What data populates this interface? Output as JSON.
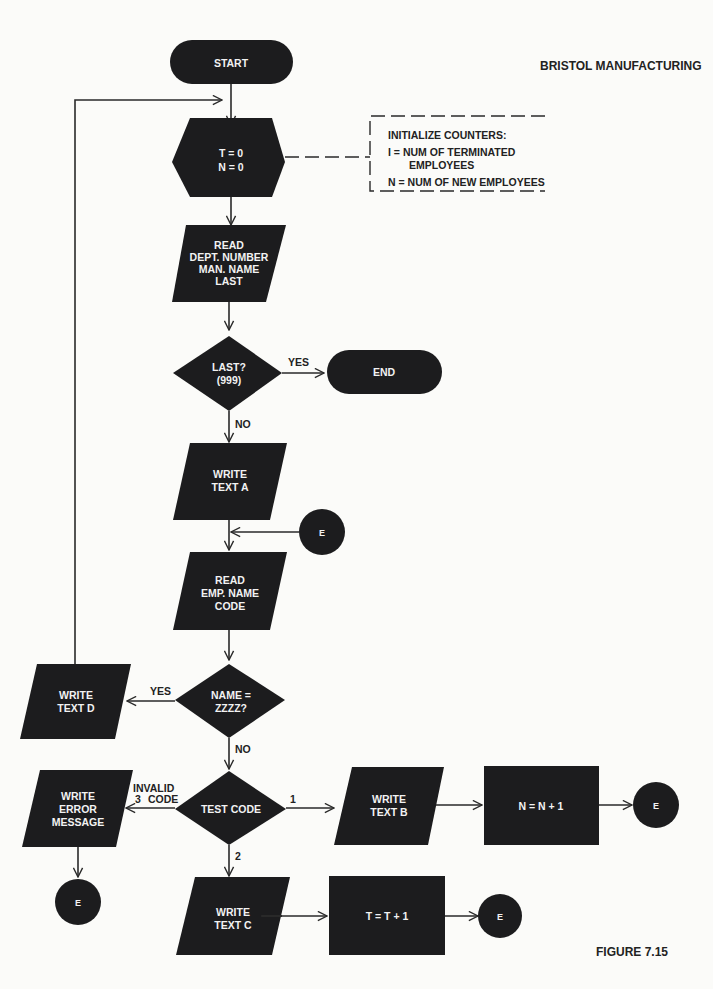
{
  "header": {
    "title": "BRISTOL MANUFACTURING"
  },
  "figure_label": "FIGURE 7.15",
  "annotation": {
    "title": "INITIALIZE COUNTERS:",
    "line1": "I  = NUM OF TERMINATED",
    "line1b": "EMPLOYEES",
    "line2": "N = NUM OF NEW EMPLOYEES"
  },
  "nodes": {
    "start": "START",
    "init": [
      "T = 0",
      "N = 0"
    ],
    "read_dept": [
      "READ",
      "DEPT. NUMBER",
      "MAN. NAME",
      "LAST"
    ],
    "last_decision": [
      "LAST?",
      "(999)"
    ],
    "end": "END",
    "write_a": [
      "WRITE",
      "TEXT A"
    ],
    "connector_e": "E",
    "read_emp": [
      "READ",
      "EMP. NAME",
      "CODE"
    ],
    "name_decision": [
      "NAME =",
      "ZZZZ?"
    ],
    "write_d": [
      "WRITE",
      "TEXT D"
    ],
    "test_code": "TEST CODE",
    "write_error": [
      "WRITE",
      "ERROR",
      "MESSAGE"
    ],
    "write_b": [
      "WRITE",
      "TEXT B"
    ],
    "inc_n": "N = N + 1",
    "write_c": [
      "WRITE",
      "TEXT C"
    ],
    "inc_t": "T = T + 1"
  },
  "edge_labels": {
    "yes": "YES",
    "no": "NO",
    "invalid": "INVALID",
    "code": "CODE",
    "branch1": "1",
    "branch2": "2",
    "branch3": "3"
  }
}
